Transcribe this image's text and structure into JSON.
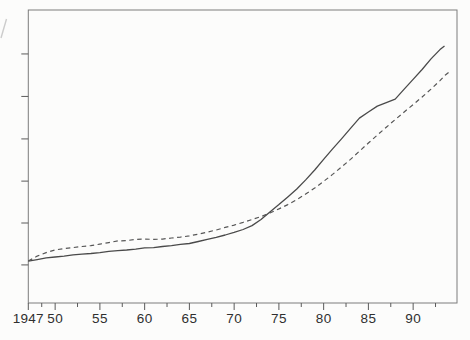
{
  "colors": {
    "paper": "#fcfcfb",
    "frame": "#7c7c7c",
    "tick": "#5a5a5a",
    "line_solid": "#4a4a4a",
    "line_dashed": "#565656",
    "label_text": "#2f2f2f",
    "artifact": "#bdbdbd"
  },
  "chart_data": {
    "type": "line",
    "title": "",
    "subtitle": "",
    "grid": false,
    "legend": "none",
    "x_axis": {
      "label": "",
      "range": [
        1947,
        1994.9
      ],
      "major_ticks": [
        {
          "year": 1947,
          "label": "1947"
        },
        {
          "year": 1950,
          "label": "50"
        },
        {
          "year": 1955,
          "label": "55"
        },
        {
          "year": 1960,
          "label": "60"
        },
        {
          "year": 1965,
          "label": "65"
        },
        {
          "year": 1970,
          "label": "70"
        },
        {
          "year": 1975,
          "label": "75"
        },
        {
          "year": 1980,
          "label": "80"
        },
        {
          "year": 1985,
          "label": "85"
        },
        {
          "year": 1990,
          "label": "90"
        }
      ],
      "minor_tick_years": [
        1948.5,
        1952.5,
        1957.5,
        1962.5,
        1967.5,
        1972.5,
        1977.5,
        1982.5,
        1987.5,
        1992.5
      ]
    },
    "y_axis": {
      "label": "",
      "labels_visible": false,
      "tick_fractions": [
        0.13,
        0.273,
        0.416,
        0.56,
        0.705,
        0.85
      ]
    },
    "series": [
      {
        "name": "solid-line",
        "style": "solid",
        "points": [
          [
            1947,
            0.143
          ],
          [
            1948,
            0.148
          ],
          [
            1949,
            0.154
          ],
          [
            1950,
            0.157
          ],
          [
            1951,
            0.16
          ],
          [
            1952,
            0.164
          ],
          [
            1953,
            0.167
          ],
          [
            1954,
            0.169
          ],
          [
            1955,
            0.172
          ],
          [
            1956,
            0.176
          ],
          [
            1957,
            0.179
          ],
          [
            1958,
            0.181
          ],
          [
            1959,
            0.184
          ],
          [
            1960,
            0.188
          ],
          [
            1961,
            0.189
          ],
          [
            1962,
            0.193
          ],
          [
            1963,
            0.196
          ],
          [
            1964,
            0.2
          ],
          [
            1965,
            0.203
          ],
          [
            1966,
            0.21
          ],
          [
            1967,
            0.217
          ],
          [
            1968,
            0.224
          ],
          [
            1969,
            0.232
          ],
          [
            1970,
            0.241
          ],
          [
            1971,
            0.251
          ],
          [
            1972,
            0.264
          ],
          [
            1973,
            0.285
          ],
          [
            1974,
            0.311
          ],
          [
            1975,
            0.336
          ],
          [
            1976,
            0.362
          ],
          [
            1977,
            0.389
          ],
          [
            1978,
            0.42
          ],
          [
            1979,
            0.454
          ],
          [
            1980,
            0.49
          ],
          [
            1981,
            0.526
          ],
          [
            1982,
            0.56
          ],
          [
            1983,
            0.596
          ],
          [
            1984,
            0.631
          ],
          [
            1985,
            0.652
          ],
          [
            1986,
            0.672
          ],
          [
            1987,
            0.684
          ],
          [
            1988,
            0.696
          ],
          [
            1989,
            0.73
          ],
          [
            1990,
            0.763
          ],
          [
            1991,
            0.797
          ],
          [
            1992,
            0.833
          ],
          [
            1993,
            0.865
          ],
          [
            1993.5,
            0.877
          ]
        ]
      },
      {
        "name": "dashed-line",
        "style": "dashed",
        "points": [
          [
            1947,
            0.143
          ],
          [
            1948,
            0.16
          ],
          [
            1949,
            0.172
          ],
          [
            1950,
            0.181
          ],
          [
            1951,
            0.186
          ],
          [
            1952,
            0.189
          ],
          [
            1953,
            0.193
          ],
          [
            1954,
            0.196
          ],
          [
            1955,
            0.201
          ],
          [
            1956,
            0.206
          ],
          [
            1957,
            0.212
          ],
          [
            1958,
            0.213
          ],
          [
            1959,
            0.217
          ],
          [
            1960,
            0.218
          ],
          [
            1961,
            0.217
          ],
          [
            1962,
            0.218
          ],
          [
            1963,
            0.222
          ],
          [
            1964,
            0.225
          ],
          [
            1965,
            0.229
          ],
          [
            1966,
            0.235
          ],
          [
            1967,
            0.242
          ],
          [
            1968,
            0.249
          ],
          [
            1969,
            0.258
          ],
          [
            1970,
            0.266
          ],
          [
            1971,
            0.275
          ],
          [
            1972,
            0.285
          ],
          [
            1973,
            0.295
          ],
          [
            1974,
            0.307
          ],
          [
            1975,
            0.321
          ],
          [
            1976,
            0.336
          ],
          [
            1977,
            0.353
          ],
          [
            1978,
            0.372
          ],
          [
            1979,
            0.392
          ],
          [
            1980,
            0.415
          ],
          [
            1981,
            0.439
          ],
          [
            1982,
            0.464
          ],
          [
            1983,
            0.49
          ],
          [
            1984,
            0.518
          ],
          [
            1985,
            0.546
          ],
          [
            1986,
            0.573
          ],
          [
            1987,
            0.6
          ],
          [
            1988,
            0.626
          ],
          [
            1989,
            0.652
          ],
          [
            1990,
            0.677
          ],
          [
            1991,
            0.703
          ],
          [
            1992,
            0.73
          ],
          [
            1993,
            0.759
          ],
          [
            1993.6,
            0.778
          ],
          [
            1994.2,
            0.792
          ]
        ]
      }
    ]
  }
}
